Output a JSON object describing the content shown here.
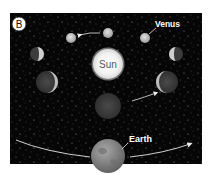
{
  "figure": {
    "panel_label": "B",
    "caption_top": "",
    "caption_bottom": "",
    "labels": {
      "venus": "Venus",
      "sun": "Sun",
      "earth": "Earth"
    },
    "colors": {
      "background": "#060606",
      "sun": "#f4f4f4",
      "venus_lit": "#c9c9c9",
      "venus_dark": "#3a3a3a",
      "earth": "#8a8a8a",
      "arrow": "#e8e8e8",
      "label": "#ffffff"
    },
    "venus_phases": [
      {
        "name": "top-left",
        "cx": 71,
        "cy": 38,
        "r": 5,
        "phase": "gibbous"
      },
      {
        "name": "top-center",
        "cx": 108,
        "cy": 33,
        "r": 5,
        "phase": "full"
      },
      {
        "name": "top-right",
        "cx": 145,
        "cy": 38,
        "r": 5,
        "phase": "gibbous"
      },
      {
        "name": "mid-left",
        "cx": 37,
        "cy": 54,
        "r": 7,
        "phase": "half"
      },
      {
        "name": "mid-right",
        "cx": 176,
        "cy": 54,
        "r": 7,
        "phase": "half"
      },
      {
        "name": "low-left",
        "cx": 47,
        "cy": 82,
        "r": 11,
        "phase": "crescent"
      },
      {
        "name": "low-right",
        "cx": 167,
        "cy": 82,
        "r": 11,
        "phase": "crescent"
      },
      {
        "name": "bottom-center",
        "cx": 108,
        "cy": 106,
        "r": 13,
        "phase": "new"
      }
    ]
  }
}
